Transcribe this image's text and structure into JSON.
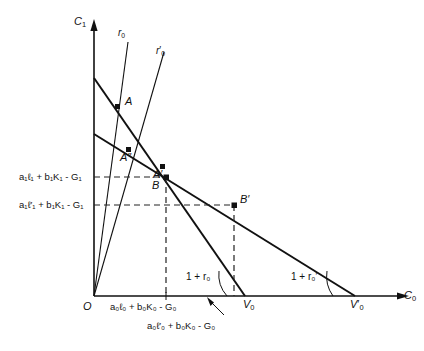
{
  "figure": {
    "type": "economics-two-period-budget-diagram",
    "axes": {
      "y_label": "C",
      "y_sub": "1",
      "x_label": "C",
      "x_sub": "0",
      "origin_label": "O"
    },
    "rays": [
      {
        "name": "ray-r0",
        "label": "r",
        "sub": "0",
        "prime": ""
      },
      {
        "name": "ray-r0p",
        "label": "r",
        "sub": "0",
        "prime": "′"
      }
    ],
    "points": [
      {
        "name": "point-A",
        "label": "A"
      },
      {
        "name": "point-A2prime",
        "label": "A″"
      },
      {
        "name": "point-Aprime",
        "label": "A′"
      },
      {
        "name": "point-B",
        "label": "B"
      },
      {
        "name": "point-Bprime",
        "label": "B′"
      }
    ],
    "y_ticks": [
      {
        "name": "y-tick-upper",
        "text": "a₁ℓ₁ + b₁K₁ - G₁"
      },
      {
        "name": "y-tick-lower",
        "text": "a₁ℓ′₁ + b₁K₁ - G₁"
      }
    ],
    "x_ticks": [
      {
        "name": "x-tick-upper",
        "text": "a₀ℓ₀ + b₀K₀ - G₀"
      },
      {
        "name": "x-tick-lower",
        "text": "a₀ℓ′₀ + b₀K₀ - G₀"
      }
    ],
    "intercepts": [
      {
        "name": "intercept-V0",
        "label": "V",
        "sub": "0",
        "prime": ""
      },
      {
        "name": "intercept-V0prime",
        "label": "V",
        "sub": "0",
        "prime": "′"
      }
    ],
    "slope_labels": [
      {
        "name": "slope-1plusr0",
        "text": "1 + r₀"
      },
      {
        "name": "slope-1plusr0prime",
        "text": "1 + r₀′"
      }
    ],
    "colors": {
      "line": "#111111",
      "dashed": "#333333",
      "background": "#ffffff"
    }
  }
}
